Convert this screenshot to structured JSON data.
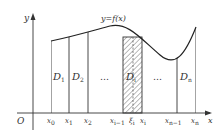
{
  "diagram": {
    "curve_label": "y=f(x)",
    "axes": {
      "x": "x",
      "y": "y",
      "origin": "O"
    },
    "x_ticks": [
      {
        "base": "x",
        "sub": "0"
      },
      {
        "base": "x",
        "sub": "1"
      },
      {
        "base": "x",
        "sub": "2"
      },
      {
        "base": "x",
        "sub": "i−1"
      },
      {
        "base": "ξ",
        "sub": "i"
      },
      {
        "base": "x",
        "sub": "i"
      },
      {
        "base": "x",
        "sub": "n−1"
      },
      {
        "base": "x",
        "sub": "n"
      }
    ],
    "regions": [
      {
        "base": "D",
        "sub": "1"
      },
      {
        "base": "D",
        "sub": "2"
      },
      {
        "base": "D",
        "sub": "i"
      },
      {
        "base": "D",
        "sub": "n"
      }
    ],
    "ellipsis": "…",
    "colors": {
      "stroke": "#333333",
      "hatch": "#555555"
    }
  }
}
